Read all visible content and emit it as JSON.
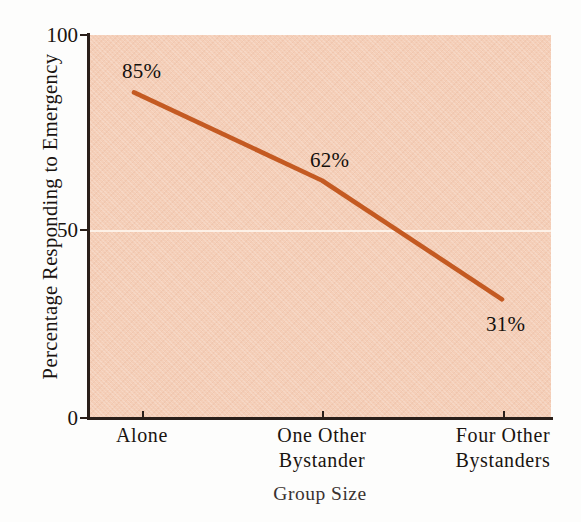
{
  "chart_data": {
    "type": "line",
    "title": "",
    "xlabel": "Group Size",
    "ylabel": "Percentage Responding to Emergency",
    "categories": [
      "Alone",
      "One Other Bystander",
      "Four Other Bystanders"
    ],
    "category_lines": [
      [
        "Alone"
      ],
      [
        "One Other",
        "Bystander"
      ],
      [
        "Four Other",
        "Bystanders"
      ]
    ],
    "values": [
      85,
      62,
      31
    ],
    "point_labels": [
      "85%",
      "62%",
      "31%"
    ],
    "ylim": [
      0,
      100
    ],
    "yticks": [
      0,
      50,
      100
    ],
    "ytick_labels": [
      "0",
      "50",
      "100"
    ],
    "grid": "horizontal-at-50",
    "legend": "none",
    "series": [
      {
        "name": "Percentage Responding to Emergency",
        "values": [
          85,
          62,
          31
        ],
        "color": "#c45a22"
      }
    ]
  },
  "axes": {
    "y_title": "Percentage Responding to Emergency",
    "x_title": "Group Size",
    "y_ticks": [
      {
        "label": "100",
        "value": 100
      },
      {
        "label": "50",
        "value": 50
      },
      {
        "label": "0",
        "value": 0
      }
    ],
    "x_ticks": [
      {
        "line1": "Alone",
        "line2": ""
      },
      {
        "line1": "One Other",
        "line2": "Bystander"
      },
      {
        "line1": "Four Other",
        "line2": "Bystanders"
      }
    ]
  },
  "annotations": [
    {
      "text": "85%"
    },
    {
      "text": "62%"
    },
    {
      "text": "31%"
    }
  ],
  "colors": {
    "plot_background": "#f4cdb6",
    "line": "#c45a22",
    "gridline": "#fdf3ea",
    "axis": "#2a1f1a",
    "text": "#1a1410",
    "page_background": "#fdfdfc"
  }
}
